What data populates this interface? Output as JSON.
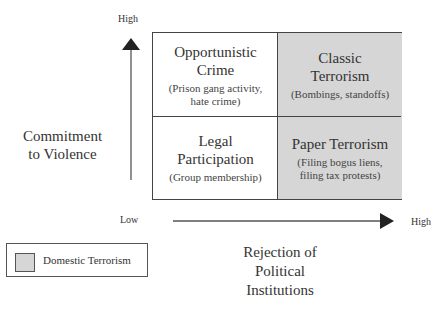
{
  "diagram": {
    "y_axis": {
      "label_line1": "Commitment",
      "label_line2": "to Violence",
      "high_label": "High"
    },
    "x_axis": {
      "label_line1": "Rejection of",
      "label_line2": "Political",
      "label_line3": "Institutions",
      "low_label": "Low",
      "high_label": "High"
    },
    "quadrants": {
      "top_left": {
        "title_line1": "Opportunistic",
        "title_line2": "Crime",
        "sub_line1": "(Prison gang activity,",
        "sub_line2": "hate crime)",
        "shaded": false
      },
      "top_right": {
        "title_line1": "Classic",
        "title_line2": "Terrorism",
        "sub_line1": "(Bombings, standoffs)",
        "shaded": true
      },
      "bottom_left": {
        "title_line1": "Legal",
        "title_line2": "Participation",
        "sub_line1": "(Group membership)",
        "shaded": false
      },
      "bottom_right": {
        "title_line1": "Paper Terrorism",
        "sub_line1": "(Filing bogus liens,",
        "sub_line2": "filing tax protests)",
        "shaded": true
      }
    },
    "legend": {
      "label": "Domestic Terrorism",
      "swatch_color": "#d6d6d6"
    },
    "colors": {
      "shade": "#d6d6d6",
      "line": "#444444",
      "arrow": "#222222"
    }
  }
}
